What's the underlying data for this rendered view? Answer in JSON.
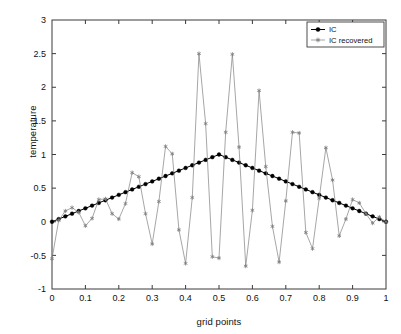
{
  "chart_data": {
    "type": "line",
    "title": "",
    "xlabel": "grid points",
    "ylabel": "temperature",
    "xlim": [
      0,
      1
    ],
    "ylim": [
      -1,
      3
    ],
    "xticks": [
      0,
      0.1,
      0.2,
      0.3,
      0.4,
      0.5,
      0.6,
      0.7,
      0.8,
      0.9,
      1
    ],
    "xticklabels": [
      "0",
      "0.1",
      "0.2",
      "0.3",
      "0.4",
      "0.5",
      "0.6",
      "0.7",
      "0.8",
      "0.9",
      "1"
    ],
    "yticks": [
      -1,
      -0.5,
      0,
      0.5,
      1,
      1.5,
      2,
      2.5,
      3
    ],
    "yticklabels": [
      "-1",
      "-0.5",
      "0",
      "0.5",
      "1",
      "1.5",
      "2",
      "2.5",
      "3"
    ],
    "grid": false,
    "legend_position": "top-right",
    "series": [
      {
        "name": "IC",
        "color": "#000000",
        "marker": "filled-circle",
        "linewidth": 1.0,
        "x": [
          0,
          0.02,
          0.04,
          0.06,
          0.08,
          0.1,
          0.12,
          0.14,
          0.16,
          0.18,
          0.2,
          0.22,
          0.24,
          0.26,
          0.28,
          0.3,
          0.32,
          0.34,
          0.36,
          0.38,
          0.4,
          0.42,
          0.44,
          0.46,
          0.48,
          0.5,
          0.52,
          0.54,
          0.56,
          0.58,
          0.6,
          0.62,
          0.64,
          0.66,
          0.68,
          0.7,
          0.72,
          0.74,
          0.76,
          0.78,
          0.8,
          0.82,
          0.84,
          0.86,
          0.88,
          0.9,
          0.92,
          0.94,
          0.96,
          0.98,
          1
        ],
        "y": [
          0,
          0.04,
          0.08,
          0.12,
          0.16,
          0.2,
          0.24,
          0.28,
          0.32,
          0.36,
          0.4,
          0.44,
          0.48,
          0.52,
          0.56,
          0.6,
          0.64,
          0.68,
          0.72,
          0.76,
          0.8,
          0.84,
          0.88,
          0.92,
          0.96,
          1.0,
          0.96,
          0.92,
          0.88,
          0.84,
          0.8,
          0.76,
          0.72,
          0.68,
          0.64,
          0.6,
          0.56,
          0.52,
          0.48,
          0.44,
          0.4,
          0.36,
          0.32,
          0.28,
          0.24,
          0.2,
          0.16,
          0.12,
          0.08,
          0.04,
          0
        ]
      },
      {
        "name": "IC recovered",
        "color": "#808080",
        "marker": "star",
        "linewidth": 0.7,
        "x": [
          0,
          0.02,
          0.04,
          0.06,
          0.08,
          0.1,
          0.12,
          0.14,
          0.16,
          0.18,
          0.2,
          0.22,
          0.24,
          0.26,
          0.28,
          0.3,
          0.32,
          0.34,
          0.36,
          0.38,
          0.4,
          0.42,
          0.44,
          0.46,
          0.48,
          0.5,
          0.52,
          0.54,
          0.56,
          0.58,
          0.6,
          0.62,
          0.64,
          0.66,
          0.68,
          0.7,
          0.72,
          0.74,
          0.76,
          0.78,
          0.8,
          0.82,
          0.84,
          0.86,
          0.88,
          0.9,
          0.92,
          0.94,
          0.96,
          0.98,
          1
        ],
        "y": [
          -0.55,
          0.02,
          0.16,
          0.21,
          0.14,
          -0.06,
          0.05,
          0.33,
          0.34,
          0.12,
          0.04,
          0.27,
          0.73,
          0.67,
          0.12,
          -0.33,
          0.3,
          1.12,
          1.01,
          -0.12,
          -0.62,
          0.36,
          2.5,
          1.46,
          -0.52,
          -0.54,
          1.33,
          2.49,
          1.11,
          -0.66,
          0.17,
          1.95,
          0.82,
          -0.07,
          -0.6,
          0.31,
          1.33,
          1.32,
          -0.16,
          -0.4,
          0.35,
          1.1,
          0.62,
          -0.21,
          0.04,
          0.33,
          0.28,
          0.12,
          -0.02,
          0.07,
          0.0
        ]
      }
    ]
  },
  "legend": {
    "items": [
      {
        "label": "IC"
      },
      {
        "label": "IC recovered"
      }
    ]
  }
}
